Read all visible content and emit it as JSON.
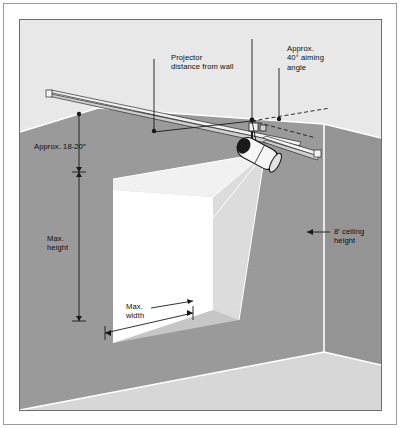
{
  "figure": {
    "kind": "technical-illustration"
  },
  "colors": {
    "ceiling": "#e8e8e8",
    "wall_left": "#9a9a9a",
    "wall_right": "#949494",
    "floor": "#d7d7d7",
    "beam": "#c8c8c8",
    "screen": "#ffffff",
    "outline": "#ffffff",
    "ink": "#0e0e0e",
    "frame": "#6d6d6d",
    "fixture_body": "#f4f4f4",
    "fixture_lens": "#1a1a1a"
  },
  "labels": {
    "projector_distance": {
      "line1": "Projector",
      "line2": "distance from wall"
    },
    "aiming_angle": {
      "line1": "Approx.",
      "line2": "40° aiming",
      "line3": "angle"
    },
    "mounting_drop": "Approx. 18-20″",
    "max_height": {
      "line1": "Max.",
      "line2": "height"
    },
    "max_width": {
      "line1": "Max.",
      "line2": "width"
    },
    "ceiling_height": {
      "line1": "8′ ceiling",
      "line2": "height"
    }
  },
  "measurements": {
    "aiming_angle_degrees": 40,
    "mounting_drop_inches": "18-20",
    "ceiling_height_feet": 8
  },
  "parts": {
    "track": "ceiling-mounted lighting track",
    "fixture": "cylindrical projector head on drop stem",
    "screen": "projected image area on left wall",
    "beam": "light cone from projector to screen"
  }
}
